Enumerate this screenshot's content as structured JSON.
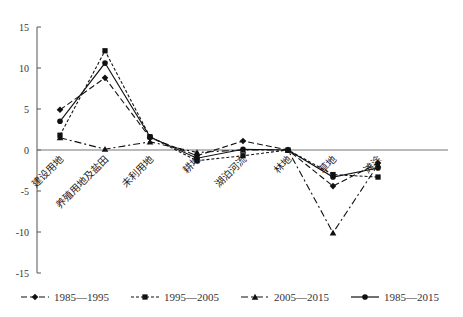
{
  "chart_data": {
    "type": "line",
    "title": "",
    "xlabel": "",
    "ylabel": "",
    "ylim": [
      -15,
      15
    ],
    "yticks": [
      15,
      10,
      5,
      0,
      -5,
      -10,
      -15
    ],
    "grid": false,
    "legend_position": "bottom",
    "categories": [
      "建设用地",
      "养殖用地及盐田",
      "未利用地",
      "耕地",
      "湖泊河流",
      "林地",
      "草地",
      "滩涂"
    ],
    "series": [
      {
        "name": "1985—1995",
        "marker": "diamond",
        "dash": "6,3",
        "values": [
          4.9,
          8.8,
          1.5,
          -0.7,
          1.1,
          0.0,
          -4.4,
          -1.6
        ]
      },
      {
        "name": "1995—2005",
        "marker": "square",
        "dash": "3,2",
        "values": [
          1.8,
          12.1,
          1.6,
          -1.3,
          -0.7,
          0.0,
          -3.0,
          -3.3
        ]
      },
      {
        "name": "2005—2015",
        "marker": "triangle",
        "dash": "7,3,2,3",
        "values": [
          1.5,
          0.1,
          1.0,
          -0.3,
          0.0,
          0.0,
          -10.1,
          -1.8
        ]
      },
      {
        "name": "1985—2015",
        "marker": "circle",
        "dash": "",
        "values": [
          3.5,
          10.6,
          1.6,
          -1.0,
          0.1,
          0.0,
          -3.3,
          -2.2
        ]
      }
    ]
  }
}
